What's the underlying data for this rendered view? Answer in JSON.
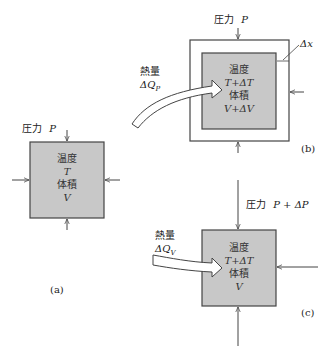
{
  "colors": {
    "box_fill": "#c8c8c8",
    "stroke": "#444444",
    "background": "#ffffff"
  },
  "panel_a": {
    "caption": "(a)",
    "pressure_label": "圧力",
    "pressure_symbol": "P",
    "temp_label": "温度",
    "temp_symbol": "T",
    "volume_label": "体積",
    "volume_symbol": "V"
  },
  "panel_b": {
    "caption": "(b)",
    "pressure_label": "圧力",
    "pressure_symbol": "P",
    "heat_label": "熱量",
    "heat_symbol": "ΔQ",
    "heat_subscript": "P",
    "temp_label": "温度",
    "temp_symbol": "T+ΔT",
    "volume_label": "体積",
    "volume_symbol": "V+ΔV",
    "displacement_label": "Δx"
  },
  "panel_c": {
    "caption": "(c)",
    "pressure_label": "圧力",
    "pressure_symbol": "P + ΔP",
    "heat_label": "熱量",
    "heat_symbol": "ΔQ",
    "heat_subscript": "V",
    "temp_label": "温度",
    "temp_symbol": "T+ΔT",
    "volume_label": "体積",
    "volume_symbol": "V"
  }
}
